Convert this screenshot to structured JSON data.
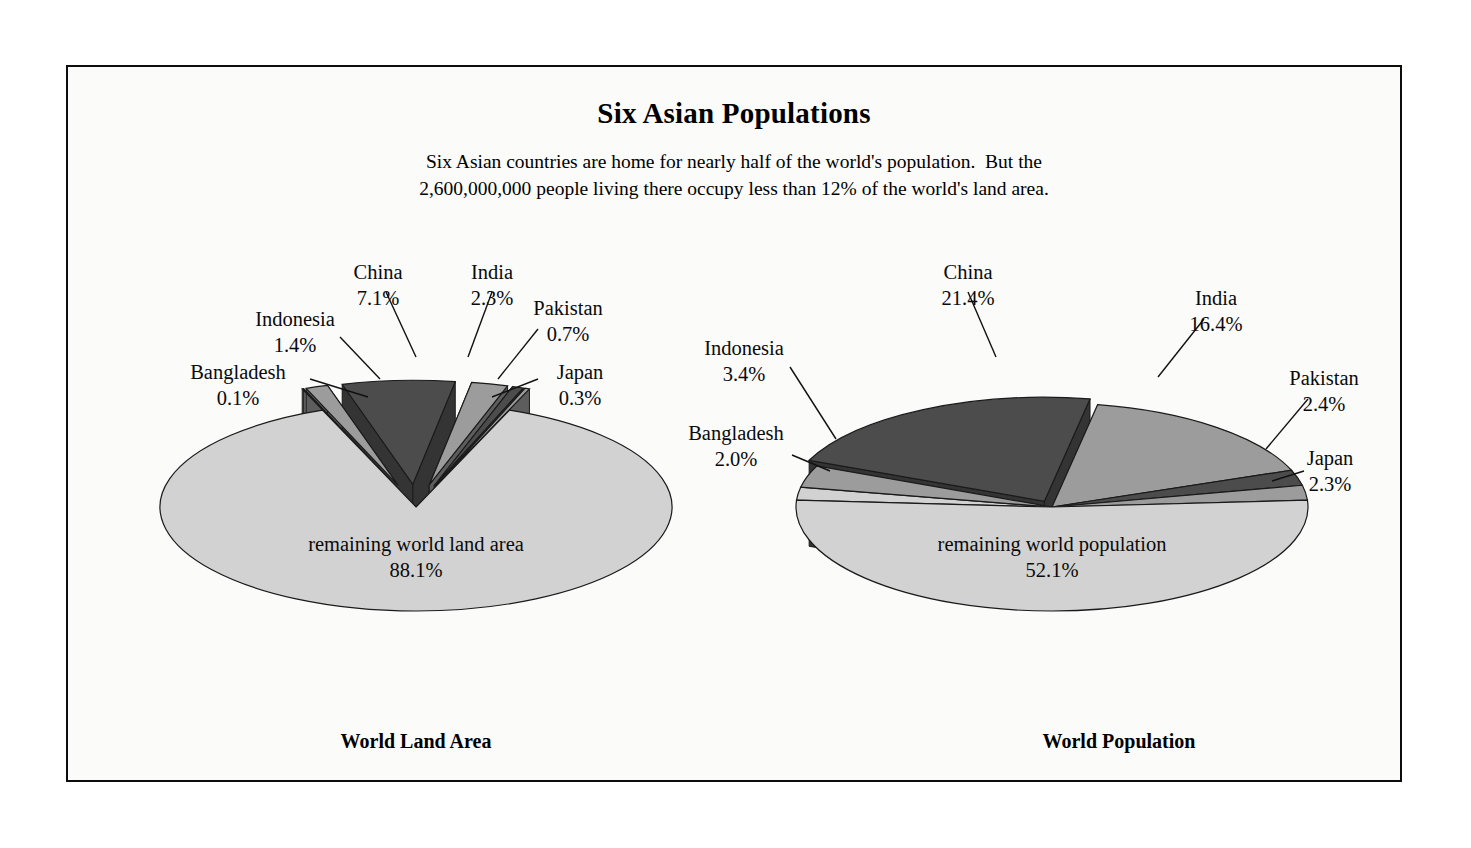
{
  "title": "Six Asian Populations",
  "subtitle_lines": [
    "Six Asian countries are home for nearly half of the world's population.  But the",
    "2,600,000,000 people living there occupy less than 12% of the world's land area."
  ],
  "captions": {
    "left": "World Land Area",
    "right": "World Population"
  },
  "palette": {
    "page_background": "#ffffff",
    "card_background": "#fbfbfa",
    "border": "#0d0d0d",
    "text": "#0a0a0a",
    "light_gray": "#d2d2d2",
    "medium_gray": "#9c9c9c",
    "dark_gray": "#4c4c4c",
    "side_light": "#6e6e6e",
    "side_medium": "#5d5d5d",
    "side_dark": "#343434",
    "outline": "#1a1a1a"
  },
  "chart_data": [
    {
      "type": "pie",
      "title": "World Land Area",
      "unit": "%",
      "categories": [
        "China",
        "India",
        "Pakistan",
        "Japan",
        "Bangladesh",
        "Indonesia",
        "remaining world land area"
      ],
      "values": [
        7.1,
        2.3,
        0.7,
        0.3,
        0.1,
        1.4,
        88.1
      ],
      "labels": [
        {
          "name": "China",
          "value": "7.1%"
        },
        {
          "name": "India",
          "value": "2.3%"
        },
        {
          "name": "Pakistan",
          "value": "0.7%"
        },
        {
          "name": "Japan",
          "value": "0.3%"
        },
        {
          "name": "Bangladesh",
          "value": "0.1%"
        },
        {
          "name": "Indonesia",
          "value": "1.4%"
        },
        {
          "name": "remaining world land area",
          "value": "88.1%"
        }
      ],
      "exploded": [
        "China",
        "India",
        "Pakistan",
        "Japan",
        "Bangladesh",
        "Indonesia"
      ],
      "legend": "none",
      "three_d": true
    },
    {
      "type": "pie",
      "title": "World Population",
      "unit": "%",
      "categories": [
        "China",
        "India",
        "Pakistan",
        "Japan",
        "Bangladesh",
        "Indonesia",
        "remaining world population"
      ],
      "values": [
        21.4,
        16.4,
        2.4,
        2.3,
        2.0,
        3.4,
        52.1
      ],
      "labels": [
        {
          "name": "China",
          "value": "21.4%"
        },
        {
          "name": "India",
          "value": "16.4%"
        },
        {
          "name": "Pakistan",
          "value": "2.4%"
        },
        {
          "name": "Japan",
          "value": "2.3%"
        },
        {
          "name": "Bangladesh",
          "value": "2.0%"
        },
        {
          "name": "Indonesia",
          "value": "3.4%"
        },
        {
          "name": "remaining world population",
          "value": "52.1%"
        }
      ],
      "exploded": [
        "China"
      ],
      "legend": "none",
      "three_d": true
    }
  ],
  "left_chart": {
    "center_label_name": "remaining world land area",
    "center_label_value": "88.1%",
    "callouts": [
      {
        "name": "Bangladesh",
        "value": "0.1%"
      },
      {
        "name": "Indonesia",
        "value": "1.4%"
      },
      {
        "name": "China",
        "value": "7.1%"
      },
      {
        "name": "India",
        "value": "2.3%"
      },
      {
        "name": "Pakistan",
        "value": "0.7%"
      },
      {
        "name": "Japan",
        "value": "0.3%"
      }
    ]
  },
  "right_chart": {
    "center_label_name": "remaining world population",
    "center_label_value": "52.1%",
    "callouts": [
      {
        "name": "Bangladesh",
        "value": "2.0%"
      },
      {
        "name": "Indonesia",
        "value": "3.4%"
      },
      {
        "name": "China",
        "value": "21.4%"
      },
      {
        "name": "India",
        "value": "16.4%"
      },
      {
        "name": "Pakistan",
        "value": "2.4%"
      },
      {
        "name": "Japan",
        "value": "2.3%"
      }
    ]
  }
}
